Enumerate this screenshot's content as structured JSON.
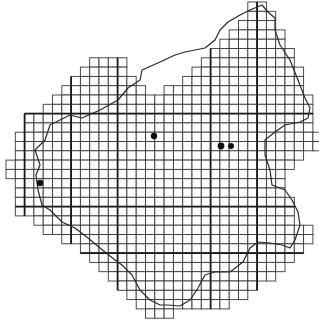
{
  "map": {
    "type": "grid-distribution-map",
    "background": "#ffffff",
    "grid_color": "#3a3a3a",
    "grid": {
      "origin_x": 6,
      "origin_y": 2,
      "cell_size": 9.3,
      "rows": [
        [
          [
            26,
            27
          ]
        ],
        [
          [
            26,
            28
          ]
        ],
        [
          [
            25,
            28
          ]
        ],
        [
          [
            24,
            29
          ]
        ],
        [
          [
            23,
            29
          ]
        ],
        [
          [
            22,
            30
          ]
        ],
        [
          [
            9,
            12
          ],
          [
            21,
            30
          ]
        ],
        [
          [
            8,
            12
          ],
          [
            20,
            31
          ]
        ],
        [
          [
            7,
            13
          ],
          [
            19,
            31
          ]
        ],
        [
          [
            6,
            14
          ],
          [
            17,
            31
          ]
        ],
        [
          [
            5,
            32
          ]
        ],
        [
          [
            4,
            32
          ]
        ],
        [
          [
            2,
            32
          ]
        ],
        [
          [
            2,
            32
          ]
        ],
        [
          [
            1,
            33
          ]
        ],
        [
          [
            1,
            33
          ]
        ],
        [
          [
            1,
            31
          ]
        ],
        [
          [
            0,
            30
          ]
        ],
        [
          [
            0,
            29
          ]
        ],
        [
          [
            1,
            29
          ]
        ],
        [
          [
            1,
            29
          ]
        ],
        [
          [
            1,
            30
          ]
        ],
        [
          [
            1,
            30
          ]
        ],
        [
          [
            3,
            30
          ]
        ],
        [
          [
            4,
            32
          ]
        ],
        [
          [
            6,
            32
          ]
        ],
        [
          [
            8,
            31
          ]
        ],
        [
          [
            9,
            30
          ]
        ],
        [
          [
            10,
            29
          ]
        ],
        [
          [
            11,
            28
          ]
        ],
        [
          [
            12,
            26
          ]
        ],
        [
          [
            13,
            25
          ]
        ],
        [
          [
            14,
            23
          ]
        ],
        [
          [
            15,
            17
          ]
        ]
      ],
      "bold_cols": [
        2,
        7,
        12,
        22,
        27
      ],
      "bold_rows": [
        12,
        22,
        27
      ]
    },
    "border_path": "M40,165 L35,150 L45,140 L50,125 L70,115 L82,118 L100,110 L118,100 L128,88 L140,80 L142,70 L160,62 L175,55 L185,52 L205,48 L215,40 L220,30 L228,22 L240,15 L250,10 L262,5 L268,12 L275,18 L275,30 L280,45 L290,60 L298,80 L305,98 L310,108 L308,118 L300,122 L285,125 L275,132 L265,140 L265,155 L270,170 L272,185 L285,190 L292,200 L298,212 L300,225 L295,240 L290,248 L282,245 L270,243 L258,242 L250,248 L243,262 L230,272 L215,272 L205,275 L198,288 L190,300 L180,306 L168,305 L160,305 L150,300 L140,290 L132,275 L122,265 L115,260 L100,248 L88,238 L75,228 L62,222 L50,210 L42,205 L38,190 L36,175 Z",
    "occurrence_dots": [
      {
        "x": 154,
        "y": 136,
        "r": 3.2
      },
      {
        "x": 221,
        "y": 146,
        "r": 3.4
      },
      {
        "x": 231,
        "y": 146,
        "r": 3.0
      },
      {
        "x": 40,
        "y": 183,
        "r": 3.2
      }
    ]
  }
}
